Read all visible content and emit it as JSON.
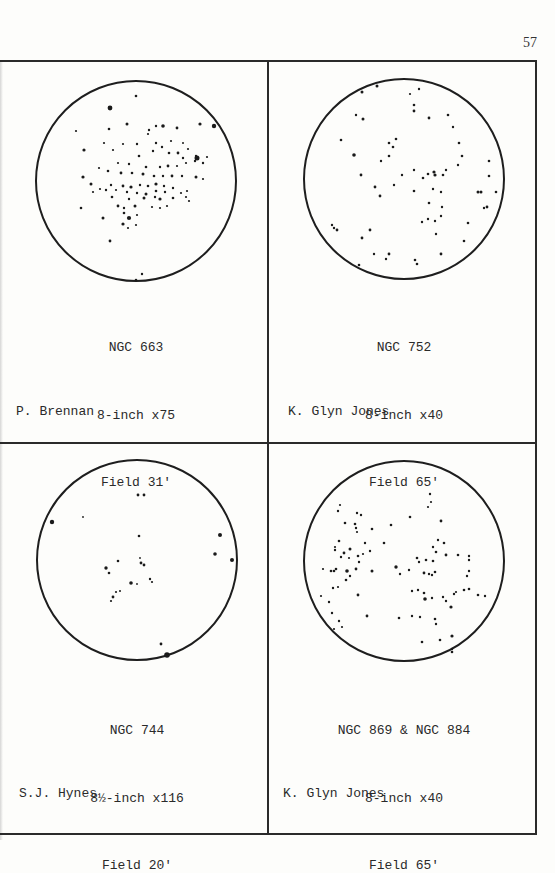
{
  "page_number": "57",
  "panels": [
    {
      "object": "NGC 663",
      "telescope": "8-inch x75",
      "field": "Field 31'",
      "observer": "P. Brennan",
      "stars": [
        [
          100,
          15,
          1.3
        ],
        [
          74,
          27,
          2.4
        ],
        [
          91,
          43,
          1.5
        ],
        [
          164,
          43,
          1.6
        ],
        [
          178,
          45,
          2.2
        ],
        [
          40,
          50,
          1.1
        ],
        [
          73,
          48,
          1.3
        ],
        [
          113,
          49,
          1.2
        ],
        [
          120,
          45,
          1.2
        ],
        [
          112,
          53,
          1.1
        ],
        [
          127,
          45,
          1.8
        ],
        [
          141,
          47,
          1.4
        ],
        [
          68,
          62,
          1.1
        ],
        [
          87,
          63,
          1.1
        ],
        [
          101,
          63,
          1.2
        ],
        [
          120,
          62,
          1.2
        ],
        [
          126,
          66,
          1.2
        ],
        [
          135,
          60,
          1.1
        ],
        [
          147,
          62,
          1.0
        ],
        [
          152,
          68,
          1.1
        ],
        [
          48,
          69,
          1.6
        ],
        [
          77,
          69,
          1.1
        ],
        [
          103,
          75,
          1.3
        ],
        [
          117,
          70,
          1.2
        ],
        [
          133,
          72,
          1.3
        ],
        [
          142,
          72,
          1.4
        ],
        [
          147,
          77,
          1.2
        ],
        [
          159,
          80,
          1.2
        ],
        [
          160,
          75,
          1.2
        ],
        [
          161,
          77,
          2.5
        ],
        [
          171,
          76,
          1.1
        ],
        [
          82,
          82,
          1.1
        ],
        [
          93,
          83,
          1.2
        ],
        [
          110,
          86,
          1.3
        ],
        [
          124,
          86,
          1.2
        ],
        [
          132,
          85,
          1.4
        ],
        [
          141,
          85,
          1.1
        ],
        [
          150,
          82,
          1.1
        ],
        [
          167,
          82,
          1.2
        ],
        [
          47,
          96,
          1.6
        ],
        [
          63,
          87,
          1.1
        ],
        [
          72,
          90,
          1.3
        ],
        [
          85,
          92,
          1.4
        ],
        [
          96,
          92,
          1.3
        ],
        [
          107,
          93,
          1.5
        ],
        [
          118,
          95,
          1.3
        ],
        [
          127,
          95,
          1.2
        ],
        [
          136,
          95,
          1.4
        ],
        [
          146,
          95,
          1.2
        ],
        [
          160,
          96,
          1.5
        ],
        [
          167,
          98,
          1.1
        ],
        [
          55,
          103,
          1.5
        ],
        [
          64,
          108,
          1.1
        ],
        [
          75,
          104,
          1.2
        ],
        [
          87,
          105,
          1.4
        ],
        [
          95,
          106,
          1.6
        ],
        [
          104,
          104,
          1.2
        ],
        [
          112,
          105,
          1.3
        ],
        [
          120,
          103,
          1.6
        ],
        [
          128,
          105,
          1.2
        ],
        [
          137,
          107,
          1.2
        ],
        [
          151,
          110,
          1.1
        ],
        [
          57,
          111,
          1.1
        ],
        [
          70,
          109,
          1.2
        ],
        [
          80,
          109,
          1.1
        ],
        [
          91,
          111,
          1.2
        ],
        [
          101,
          112,
          1.2
        ],
        [
          110,
          113,
          1.5
        ],
        [
          120,
          110,
          1.3
        ],
        [
          129,
          111,
          1.2
        ],
        [
          145,
          112,
          1.1
        ],
        [
          76,
          116,
          1.3
        ],
        [
          93,
          118,
          1.2
        ],
        [
          108,
          117,
          1.5
        ],
        [
          119,
          116,
          1.2
        ],
        [
          124,
          118,
          1.6
        ],
        [
          137,
          117,
          1.3
        ],
        [
          150,
          116,
          1.1
        ],
        [
          153,
          120,
          1.1
        ],
        [
          82,
          125,
          1.4
        ],
        [
          88,
          127,
          1.2
        ],
        [
          99,
          125,
          1.5
        ],
        [
          116,
          126,
          1.1
        ],
        [
          124,
          127,
          1.1
        ],
        [
          131,
          125,
          1.1
        ],
        [
          45,
          127,
          1.3
        ],
        [
          88,
          132,
          1.3
        ],
        [
          101,
          134,
          1.1
        ],
        [
          67,
          137,
          1.5
        ],
        [
          93,
          137,
          2.1
        ],
        [
          87,
          143,
          1.6
        ],
        [
          92,
          147,
          1.1
        ],
        [
          100,
          144,
          1.1
        ],
        [
          74,
          160,
          1.4
        ],
        [
          106,
          193,
          1.2
        ],
        [
          100,
          199,
          1.3
        ]
      ]
    },
    {
      "object": "NGC 752",
      "telescope": "8-inch x40",
      "field": "Field 65'",
      "observer": "K. Glyn Jones",
      "stars": [
        [
          58,
          13,
          1.5
        ],
        [
          73,
          7,
          1.5
        ],
        [
          106,
          15,
          1.1
        ],
        [
          115,
          10,
          1.2
        ],
        [
          110,
          26,
          1.3
        ],
        [
          110,
          32,
          1.4
        ],
        [
          52,
          36,
          1.2
        ],
        [
          59,
          40,
          1.5
        ],
        [
          125,
          39,
          1.4
        ],
        [
          144,
          36,
          1.3
        ],
        [
          149,
          48,
          1.2
        ],
        [
          37,
          61,
          1.3
        ],
        [
          92,
          60,
          1.3
        ],
        [
          85,
          64,
          1.3
        ],
        [
          89,
          68,
          1.3
        ],
        [
          155,
          64,
          1.3
        ],
        [
          50,
          76,
          1.8
        ],
        [
          85,
          77,
          1.3
        ],
        [
          77,
          82,
          1.2
        ],
        [
          158,
          77,
          1.3
        ],
        [
          154,
          86,
          1.2
        ],
        [
          142,
          91,
          1.2
        ],
        [
          185,
          82,
          1.3
        ],
        [
          110,
          91,
          1.2
        ],
        [
          124,
          95,
          1.3
        ],
        [
          130,
          93,
          1.6
        ],
        [
          131,
          96,
          1.6
        ],
        [
          119,
          99,
          1.3
        ],
        [
          139,
          96,
          1.3
        ],
        [
          57,
          96,
          1.4
        ],
        [
          98,
          96,
          1.2
        ],
        [
          185,
          97,
          1.3
        ],
        [
          90,
          106,
          1.2
        ],
        [
          71,
          108,
          1.4
        ],
        [
          110,
          112,
          1.3
        ],
        [
          129,
          110,
          1.2
        ],
        [
          137,
          113,
          1.2
        ],
        [
          174,
          113,
          1.5
        ],
        [
          177,
          113,
          1.5
        ],
        [
          192,
          113,
          1.3
        ],
        [
          76,
          117,
          1.4
        ],
        [
          125,
          124,
          1.3
        ],
        [
          138,
          128,
          1.2
        ],
        [
          183,
          128,
          1.4
        ],
        [
          180,
          129,
          1.2
        ],
        [
          137,
          137,
          1.2
        ],
        [
          124,
          140,
          1.2
        ],
        [
          118,
          143,
          1.2
        ],
        [
          131,
          142,
          1.2
        ],
        [
          164,
          144,
          1.3
        ],
        [
          28,
          146,
          1.2
        ],
        [
          30,
          149,
          1.2
        ],
        [
          33,
          151,
          1.4
        ],
        [
          66,
          151,
          1.4
        ],
        [
          58,
          159,
          1.4
        ],
        [
          132,
          155,
          1.2
        ],
        [
          160,
          162,
          1.3
        ],
        [
          70,
          175,
          1.2
        ],
        [
          85,
          175,
          1.4
        ],
        [
          82,
          180,
          1.2
        ],
        [
          55,
          186,
          1.3
        ],
        [
          111,
          181,
          1.3
        ],
        [
          113,
          185,
          1.3
        ],
        [
          137,
          175,
          1.4
        ]
      ]
    },
    {
      "object": "NGC 744",
      "telescope": "8½-inch x116",
      "field": "Field 20'",
      "observer": "S.J. Hynes",
      "stars": [
        [
          101,
          35,
          1.4
        ],
        [
          107,
          35,
          1.4
        ],
        [
          15,
          62,
          2.2
        ],
        [
          46,
          57,
          0.9
        ],
        [
          102,
          76,
          1.3
        ],
        [
          183,
          75,
          2.0
        ],
        [
          178,
          94,
          1.8
        ],
        [
          195,
          100,
          2.0
        ],
        [
          103,
          98,
          0.9
        ],
        [
          81,
          101,
          1.3
        ],
        [
          104,
          103,
          1.4
        ],
        [
          107,
          105,
          1.4
        ],
        [
          69,
          108,
          1.7
        ],
        [
          72,
          113,
          1.3
        ],
        [
          94,
          123,
          1.8
        ],
        [
          100,
          124,
          0.9
        ],
        [
          113,
          119,
          1.2
        ],
        [
          115,
          122,
          1.1
        ],
        [
          79,
          132,
          1.1
        ],
        [
          83,
          131,
          1.0
        ],
        [
          76,
          137,
          1.4
        ],
        [
          74,
          141,
          1.1
        ],
        [
          124,
          184,
          1.4
        ],
        [
          130,
          195,
          2.8
        ]
      ]
    },
    {
      "object": "NGC 869 & NGC 884",
      "telescope": "8-inch x40",
      "field": "Field 65'",
      "observer": "K. Glyn Jones",
      "stars": [
        [
          126,
          33,
          1.2
        ],
        [
          127,
          41,
          1.1
        ],
        [
          124,
          46,
          1.1
        ],
        [
          36,
          44,
          1.1
        ],
        [
          34,
          50,
          1.2
        ],
        [
          53,
          52,
          1.2
        ],
        [
          57,
          54,
          1.2
        ],
        [
          106,
          56,
          1.3
        ],
        [
          137,
          60,
          1.4
        ],
        [
          41,
          62,
          1.3
        ],
        [
          51,
          63,
          1.3
        ],
        [
          87,
          64,
          1.3
        ],
        [
          52,
          67,
          1.2
        ],
        [
          53,
          71,
          1.1
        ],
        [
          68,
          68,
          1.3
        ],
        [
          35,
          80,
          1.3
        ],
        [
          31,
          86,
          1.1
        ],
        [
          61,
          82,
          1.2
        ],
        [
          80,
          82,
          1.3
        ],
        [
          66,
          90,
          1.2
        ],
        [
          134,
          79,
          1.2
        ],
        [
          140,
          82,
          1.3
        ],
        [
          129,
          86,
          1.2
        ],
        [
          31,
          89,
          1.2
        ],
        [
          46,
          88,
          1.5
        ],
        [
          40,
          92,
          1.4
        ],
        [
          37,
          96,
          1.2
        ],
        [
          45,
          97,
          1.1
        ],
        [
          54,
          95,
          1.3
        ],
        [
          59,
          93,
          1.1
        ],
        [
          55,
          101,
          1.2
        ],
        [
          132,
          91,
          1.3
        ],
        [
          142,
          94,
          1.4
        ],
        [
          154,
          94,
          1.3
        ],
        [
          165,
          95,
          1.2
        ],
        [
          165,
          99,
          1.2
        ],
        [
          113,
          97,
          1.3
        ],
        [
          122,
          99,
          1.3
        ],
        [
          115,
          101,
          1.2
        ],
        [
          129,
          100,
          1.3
        ],
        [
          32,
          108,
          1.3
        ],
        [
          43,
          110,
          1.8
        ],
        [
          52,
          108,
          1.4
        ],
        [
          19,
          108,
          1.1
        ],
        [
          27,
          110,
          1.3
        ],
        [
          30,
          110,
          1.3
        ],
        [
          46,
          115,
          1.2
        ],
        [
          68,
          110,
          1.5
        ],
        [
          92,
          106,
          1.7
        ],
        [
          96,
          113,
          1.2
        ],
        [
          105,
          109,
          1.2
        ],
        [
          120,
          112,
          1.4
        ],
        [
          125,
          113,
          1.2
        ],
        [
          128,
          114,
          1.2
        ],
        [
          131,
          111,
          1.3
        ],
        [
          165,
          110,
          1.2
        ],
        [
          163,
          115,
          1.2
        ],
        [
          42,
          119,
          1.3
        ],
        [
          29,
          127,
          1.2
        ],
        [
          34,
          126,
          1.1
        ],
        [
          108,
          130,
          1.2
        ],
        [
          114,
          129,
          1.2
        ],
        [
          120,
          132,
          1.3
        ],
        [
          121,
          138,
          1.8
        ],
        [
          128,
          137,
          1.2
        ],
        [
          150,
          133,
          1.2
        ],
        [
          160,
          129,
          1.3
        ],
        [
          165,
          128,
          1.3
        ],
        [
          152,
          131,
          1.1
        ],
        [
          174,
          134,
          1.3
        ],
        [
          181,
          135,
          1.2
        ],
        [
          139,
          136,
          1.2
        ],
        [
          142,
          140,
          1.2
        ],
        [
          17,
          135,
          1.1
        ],
        [
          25,
          141,
          1.2
        ],
        [
          54,
          134,
          1.4
        ],
        [
          147,
          146,
          1.6
        ],
        [
          28,
          152,
          1.2
        ],
        [
          63,
          155,
          1.4
        ],
        [
          95,
          157,
          1.3
        ],
        [
          108,
          155,
          1.2
        ],
        [
          116,
          156,
          1.2
        ],
        [
          131,
          158,
          1.3
        ],
        [
          132,
          163,
          1.2
        ],
        [
          35,
          160,
          1.2
        ],
        [
          38,
          166,
          1.1
        ],
        [
          30,
          168,
          1.1
        ],
        [
          148,
          175,
          1.6
        ],
        [
          136,
          179,
          1.3
        ],
        [
          118,
          181,
          1.3
        ],
        [
          148,
          188,
          1.2
        ],
        [
          148,
          191,
          1.3
        ]
      ]
    }
  ]
}
